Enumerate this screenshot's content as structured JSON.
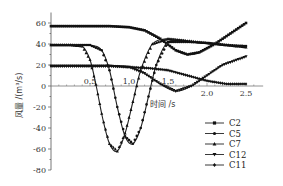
{
  "chart_data": {
    "type": "line",
    "title": "",
    "xlabel": "时间 /s",
    "ylabel": "风量 /(m³/s)",
    "xlim": [
      0,
      2.7
    ],
    "ylim": [
      -80,
      70
    ],
    "xticks": [
      0.5,
      1.0,
      1.5,
      2.0,
      2.5
    ],
    "xtick_labels": [
      "0.5",
      "1.0",
      "1.5",
      "2.0",
      "2.5"
    ],
    "yticks": [
      60,
      40,
      20,
      0,
      -20,
      -40,
      -60,
      -80
    ],
    "ytick_labels": [
      "60",
      "40",
      "20",
      "0",
      "-20",
      "-40",
      "-60",
      "-80"
    ],
    "grid": false,
    "legend_position": "lower right",
    "series": [
      {
        "name": "C2",
        "marker": "square",
        "x": [
          0,
          0.25,
          0.5,
          0.75,
          1.0,
          1.2,
          1.4,
          1.6,
          1.75,
          1.9,
          2.1,
          2.3,
          2.5
        ],
        "y": [
          57,
          57,
          57,
          57,
          56,
          53,
          45,
          34,
          30,
          32,
          40,
          50,
          60
        ]
      },
      {
        "name": "C5",
        "marker": "circle",
        "x": [
          0,
          0.25,
          0.5,
          0.65,
          0.75,
          0.85,
          0.95,
          1.05,
          1.15,
          1.25,
          1.35,
          1.5,
          1.75,
          2.0,
          2.25,
          2.5
        ],
        "y": [
          39,
          39,
          39,
          34,
          15,
          -20,
          -48,
          -55,
          -40,
          -10,
          20,
          42,
          42,
          41,
          39,
          38
        ]
      },
      {
        "name": "C7",
        "marker": "triangle",
        "x": [
          0,
          0.25,
          0.4,
          0.5,
          0.58,
          0.66,
          0.75,
          0.85,
          0.95,
          1.05,
          1.15,
          1.3,
          1.5,
          1.75,
          2.0,
          2.25,
          2.5
        ],
        "y": [
          39,
          39,
          38,
          25,
          0,
          -30,
          -55,
          -62,
          -45,
          -15,
          15,
          40,
          45,
          43,
          41,
          39,
          37
        ]
      },
      {
        "name": "C12",
        "marker": "inverted-triangle",
        "x": [
          0,
          0.25,
          0.5,
          0.75,
          1.0,
          1.2,
          1.4,
          1.6,
          1.8,
          2.0,
          2.2,
          2.5
        ],
        "y": [
          19,
          19,
          19,
          19,
          18,
          12,
          2,
          -5,
          0,
          10,
          20,
          28
        ]
      },
      {
        "name": "C11",
        "marker": "diamond",
        "x": [
          0,
          0.25,
          0.5,
          0.75,
          1.0,
          1.25,
          1.5,
          1.75,
          2.0,
          2.25,
          2.5
        ],
        "y": [
          19,
          19,
          19,
          19,
          18,
          17,
          15,
          10,
          5,
          2,
          2
        ]
      }
    ]
  },
  "legend": {
    "items": [
      {
        "label": "C2",
        "marker": "square"
      },
      {
        "label": "C5",
        "marker": "circle"
      },
      {
        "label": "C7",
        "marker": "triangle"
      },
      {
        "label": "C12",
        "marker": "inverted-triangle"
      },
      {
        "label": "C11",
        "marker": "diamond"
      }
    ]
  },
  "axes": {
    "xlabel": "时间 /s",
    "ylabel": "风量 /(m³/s)"
  }
}
